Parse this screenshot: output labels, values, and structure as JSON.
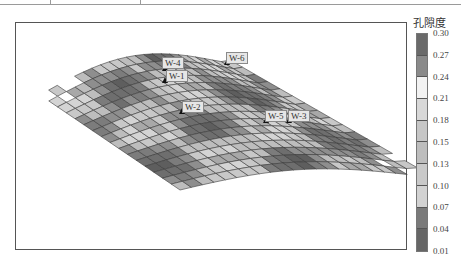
{
  "chart_data": {
    "type": "heatmap",
    "subtype": "3d-surface-grid",
    "title": "",
    "legend_title": "孔隙度",
    "colorbar": {
      "ticks": [
        "0.30",
        "0.27",
        "0.24",
        "0.21",
        "0.18",
        "0.15",
        "0.13",
        "0.10",
        "0.07",
        "0.04",
        "0.01"
      ],
      "range": [
        0.01,
        0.3
      ],
      "colors": [
        "#6a6a6a",
        "#8a8a8a",
        "#f2f2f2",
        "#d8d8d8",
        "#c6c6c6",
        "#bdbdbd",
        "#c9c9c9",
        "#d2d2d2",
        "#7a7a7a",
        "#666666"
      ]
    },
    "wells": [
      {
        "name": "W-4",
        "x": 165,
        "y": 63
      },
      {
        "name": "W-1",
        "x": 165,
        "y": 75
      },
      {
        "name": "W-6",
        "x": 227,
        "y": 57
      },
      {
        "name": "W-2",
        "x": 182,
        "y": 106
      },
      {
        "name": "W-5",
        "x": 266,
        "y": 115
      },
      {
        "name": "W-3",
        "x": 289,
        "y": 115
      }
    ],
    "grid": {
      "rows": 16,
      "cols": 22
    }
  },
  "legend": {
    "title": "孔隙度",
    "ticks": [
      "0.30",
      "0.27",
      "0.24",
      "0.21",
      "0.18",
      "0.15",
      "0.13",
      "0.10",
      "0.07",
      "0.04",
      "0.01"
    ]
  },
  "wells": {
    "w4": "W-4",
    "w1": "W-1",
    "w6": "W-6",
    "w2": "W-2",
    "w5": "W-5",
    "w3": "W-3"
  }
}
